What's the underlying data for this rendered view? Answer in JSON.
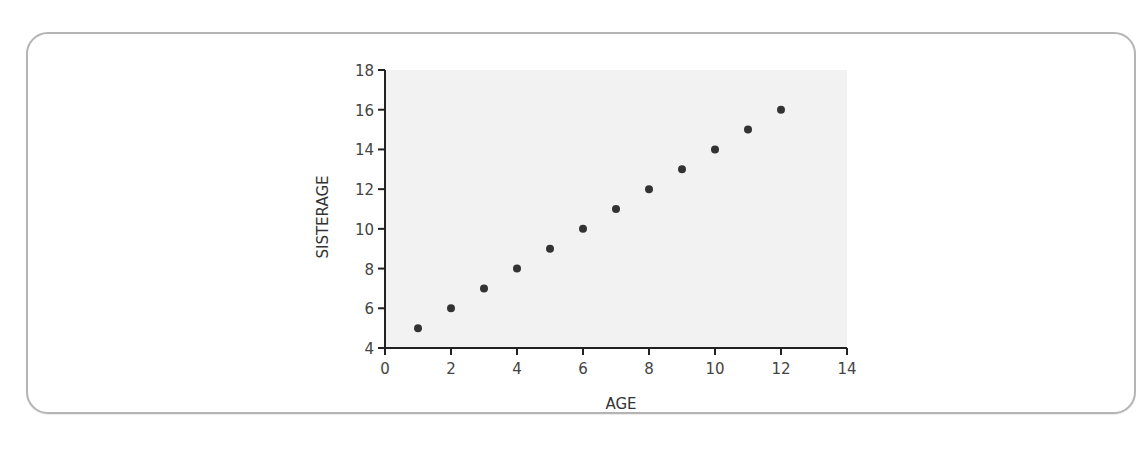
{
  "chart_data": {
    "type": "scatter",
    "title": "",
    "xlabel": "AGE",
    "ylabel": "SISTERAGE",
    "xlim": [
      0,
      14
    ],
    "ylim": [
      4,
      18
    ],
    "xticks": [
      0,
      2,
      4,
      6,
      8,
      10,
      12,
      14
    ],
    "yticks": [
      4,
      6,
      8,
      10,
      12,
      14,
      16,
      18
    ],
    "grid": false,
    "legend": null,
    "plot_background": "#f2f2f2",
    "marker_color": "#333333",
    "series": [
      {
        "name": "SISTERAGE vs AGE",
        "x": [
          1,
          2,
          3,
          4,
          5,
          6,
          7,
          8,
          9,
          10,
          11,
          12
        ],
        "y": [
          5,
          6,
          7,
          8,
          9,
          10,
          11,
          12,
          13,
          14,
          15,
          16
        ]
      }
    ]
  }
}
